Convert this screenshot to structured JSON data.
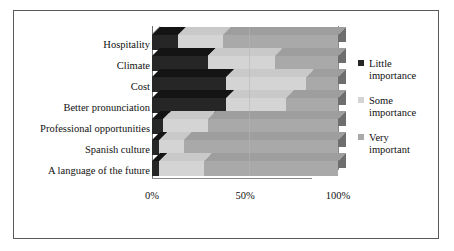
{
  "chart_data": {
    "type": "bar",
    "subtype": "stacked-bar-horizontal-3d",
    "title": "",
    "xlabel": "",
    "ylabel": "",
    "xlim": [
      0,
      100
    ],
    "grid": true,
    "legend_position": "right",
    "categories": [
      "Hospitality",
      "Climate",
      "Cost",
      "Better pronunciation",
      "Professional opportunities",
      "Spanish culture",
      "A language of the future"
    ],
    "series": [
      {
        "name": "Little importance",
        "color": "#262626",
        "values": [
          14,
          30,
          40,
          40,
          6,
          4,
          4
        ]
      },
      {
        "name": "Some importance",
        "color": "#d4d4d4",
        "values": [
          24,
          36,
          43,
          32,
          24,
          13,
          24
        ]
      },
      {
        "name": "Very important",
        "color": "#a9a9a9",
        "values": [
          62,
          34,
          17,
          28,
          70,
          83,
          72
        ]
      }
    ],
    "xticks": [
      {
        "value": 0,
        "label": "0%"
      },
      {
        "value": 50,
        "label": "50%"
      },
      {
        "value": 100,
        "label": "100%"
      }
    ]
  },
  "legend": {
    "items": [
      {
        "label_line1": "Little",
        "label_line2": "importance",
        "swatch": "little-importance-swatch"
      },
      {
        "label_line1": "Some",
        "label_line2": "importance",
        "swatch": "some-importance-swatch"
      },
      {
        "label_line1": "Very",
        "label_line2": "important",
        "swatch": "very-important-swatch"
      }
    ]
  }
}
